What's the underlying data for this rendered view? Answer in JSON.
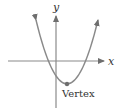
{
  "diagram": {
    "axes": {
      "x_label": "x",
      "y_label": "y"
    },
    "annotations": {
      "vertex_label": "Vertex"
    },
    "colors": {
      "axis": "#8a8a8a",
      "curve": "#8a8a8a",
      "vertex_point": "#6e6e6e",
      "text": "#333333"
    }
  }
}
